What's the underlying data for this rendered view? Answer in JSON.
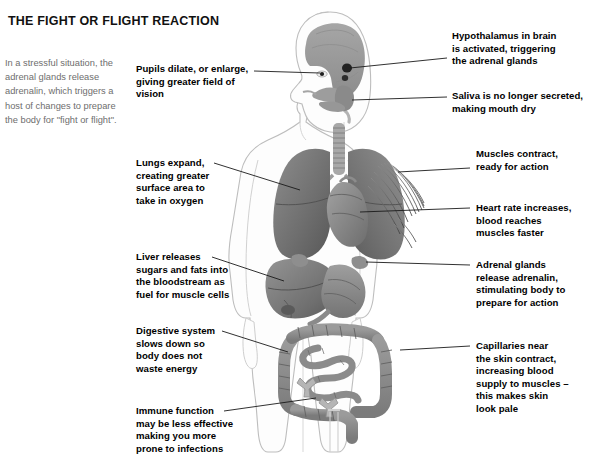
{
  "page": {
    "title": "THE FIGHT OR FLIGHT REACTION",
    "intro": "In a stressful situation, the adrenal glands release adrenalin, which triggers a host of changes to prepare the body for \"fight or flight\".",
    "background_color": "#ffffff",
    "text_color": "#000000",
    "intro_color": "#6e6e6e",
    "leader_line_color": "#1a1a1a"
  },
  "figure": {
    "name": "human-body-anatomy-illustration",
    "palette": {
      "skin_outline": "#b9b9b9",
      "body_fill": "#fcfcfc",
      "brain": "#9a9a9a",
      "organ_dark": "#6f6f6f",
      "organ_mid": "#8b8b8b",
      "organ_light": "#a9a9a9",
      "hypothalamus": "#2e2e2e"
    },
    "parts": [
      "brain",
      "hypothalamus",
      "eye",
      "salivary-glands",
      "trachea",
      "left-lung",
      "right-lung",
      "heart",
      "shoulder-muscle-fibres",
      "liver",
      "stomach",
      "adrenal-glands",
      "large-intestine",
      "small-intestine",
      "lymph-nodes",
      "leg-bone"
    ]
  },
  "callouts": {
    "left": [
      {
        "id": "pupils",
        "lines": [
          "Pupils dilate, or enlarge,",
          "giving greater field of vision"
        ]
      },
      {
        "id": "lungs",
        "lines": [
          "Lungs expand,",
          "creating greater",
          "surface area to",
          "take in oxygen"
        ]
      },
      {
        "id": "liver",
        "lines": [
          "Liver releases",
          "sugars and fats into",
          "the bloodstream as",
          "fuel for muscle cells"
        ]
      },
      {
        "id": "digestive",
        "lines": [
          "Digestive system",
          "slows down so",
          "body does not",
          "waste energy"
        ]
      },
      {
        "id": "immune",
        "lines": [
          "Immune function",
          "may be less effective",
          "making you more",
          "prone to infections"
        ]
      }
    ],
    "right": [
      {
        "id": "hypothalamus",
        "lines": [
          "Hypothalamus in brain",
          "is activated, triggering",
          "the adrenal glands"
        ]
      },
      {
        "id": "saliva",
        "lines": [
          "Saliva is no longer secreted,",
          "making mouth dry"
        ]
      },
      {
        "id": "muscles",
        "lines": [
          "Muscles contract,",
          "ready for action"
        ]
      },
      {
        "id": "heart",
        "lines": [
          "Heart rate increases,",
          "blood reaches",
          "muscles faster"
        ]
      },
      {
        "id": "adrenal",
        "lines": [
          "Adrenal glands",
          "release adrenalin,",
          "stimulating body to",
          "prepare for action"
        ]
      },
      {
        "id": "capillaries",
        "lines": [
          "Capillaries near",
          "the skin contract,",
          "increasing blood",
          "supply to muscles –",
          "this makes skin",
          "look pale"
        ]
      }
    ]
  }
}
